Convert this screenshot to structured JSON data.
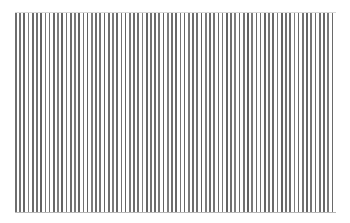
{
  "figure": {
    "background_color": "#ffffff",
    "canvas_width": 350,
    "canvas_height": 223
  },
  "chart_data": {
    "type": "bar",
    "xlabel": "",
    "ylabel": "",
    "grid": false,
    "legend": null,
    "categories": [],
    "values": [],
    "plot_area": {
      "x": 15,
      "y": 12,
      "width": 321,
      "height": 200
    },
    "stripe_count": 76,
    "stripe_period_px": 4.22,
    "stripe_width_px": 1.7,
    "stripe_color_base": "#6e6e6e",
    "stripe_color_light": "#a8a8a8",
    "stripe_color_dark": "#4a4a4a",
    "baseline_color": "#b8b8b8",
    "topline_color": "#d8d8d8",
    "stripe_intensities": [
      0.62,
      0.55,
      0.7,
      0.48,
      0.66,
      0.58,
      0.74,
      0.52,
      0.6,
      0.68,
      0.45,
      0.72,
      0.56,
      0.63,
      0.5,
      0.69,
      0.59,
      0.76,
      0.47,
      0.64,
      0.54,
      0.71,
      0.61,
      0.49,
      0.67,
      0.57,
      0.73,
      0.51,
      0.65,
      0.6,
      0.44,
      0.7,
      0.58,
      0.66,
      0.53,
      0.75,
      0.46,
      0.62,
      0.68,
      0.55,
      0.71,
      0.5,
      0.64,
      0.59,
      0.77,
      0.48,
      0.63,
      0.56,
      0.69,
      0.52,
      0.72,
      0.61,
      0.45,
      0.67,
      0.57,
      0.74,
      0.49,
      0.65,
      0.6,
      0.7,
      0.54,
      0.66,
      0.51,
      0.73,
      0.58,
      0.62,
      0.47,
      0.68,
      0.56,
      0.71,
      0.53,
      0.64,
      0.6,
      0.69,
      0.5,
      0.66
    ]
  }
}
